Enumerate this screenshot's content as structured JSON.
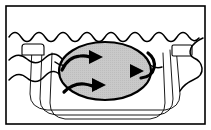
{
  "figure": {
    "width": 211,
    "height": 130,
    "background_color": "#ffffff",
    "caption": ""
  },
  "frame": {
    "label": "Figure border",
    "stroke_color": "#000000",
    "stroke_width": 1.6,
    "x": 6,
    "y": 6,
    "width": 199,
    "height": 118
  },
  "basin": {
    "label": "Basin / container walls",
    "stroke_color": "#000000",
    "fill": "none",
    "wall_count": 3,
    "walls": [
      {
        "name": "inner-wall",
        "stroke_width": 0.9,
        "path": "M 32,47 L 30,94 Q 30,108 47,110 L 165,110 Q 180,108 180,94 L 176,47"
      },
      {
        "name": "middle-wall",
        "stroke_width": 0.9,
        "path": "M 42,50 L 40,99 Q 40,113 56,115 L 158,115 Q 173,113 173,99 L 170,50"
      },
      {
        "name": "outer-wall",
        "stroke_width": 0.9,
        "path": "M 52,53 L 50,103 Q 50,117 65,119 L 150,119 Q 165,117 165,103 L 163,53"
      }
    ]
  },
  "handles": [
    {
      "name": "left-handle",
      "stroke_color": "#000000",
      "stroke_width": 1.1,
      "x": 22,
      "y": 44,
      "width": 22,
      "height": 11,
      "radius": 3
    },
    {
      "name": "right-handle",
      "stroke_color": "#000000",
      "stroke_width": 1.1,
      "x": 172,
      "y": 45,
      "width": 20,
      "height": 11,
      "radius": 2
    }
  ],
  "water_waves": {
    "label": "Water surface wave lines",
    "stroke_color": "#000000",
    "stroke_width": 1.5,
    "lines": [
      {
        "name": "wave-line-top",
        "description": "Main water surface spanning full width",
        "path": "M 9,37 q 6,-9 12,0 q 6,9 12,0 q 6,-9 12,0 q 6,9 12,0 q 6,-9 12,0 q 6,9 12,0 q 6,-9 12,0 q 6,9 12,0 q 6,-9 12,0 q 6,9 12,0 q 6,-9 12,0 q 6,9 12,0 q 6,-9 12,0 q 6,9 12,0 q 6,-9 12,0 q 5,7 10,1"
      },
      {
        "name": "wave-line-left-upper",
        "description": "Left interior wave crossing basin wall",
        "path": "M 9,60 q 9,-9 18,-1 q 9,8 18,-1 q 9,-9 18,2 q 8,10 16,3"
      },
      {
        "name": "wave-line-left-lower",
        "description": "Lower-left interior wave",
        "path": "M 9,80 q 9,-10 18,-2 q 9,8 18,-2 q 9,-10 18,2 q 9,12 18,4"
      },
      {
        "name": "wave-line-right-swirl",
        "description": "Right wave curving down toward the ellipse",
        "path": "M 203,38 q -9,4 -12,10 q -3,7 3,10 q 7,3 8,10 q 1,8 -9,12 q -9,4 -13,11"
      }
    ]
  },
  "ellipse_region": {
    "name": "convergence-zone-ellipse",
    "label": "Shaded convergence region",
    "cx": 105,
    "cy": 71,
    "rx": 46,
    "ry": 29,
    "fill_color": "#c9c9c9",
    "stroke_color": "#000000",
    "stroke_width": 2.1
  },
  "flow_arrows": {
    "label": "Flow direction arrows inside shaded zone",
    "color": "#000000",
    "stroke_width": 3.2,
    "count": 3,
    "items": [
      {
        "name": "arrow-upper-right",
        "direction": "right",
        "tail_path": "M 62,70 q 6,-13 18,-14 q 9,-1 13,3",
        "tip_points": "89,50 103,57 89,64",
        "description": "Curved arrow entering from lower-left, pointing right"
      },
      {
        "name": "arrow-lower-right",
        "direction": "right",
        "tail_path": "M 64,92 q 9,-9 20,-8 q 8,1 12,4",
        "tip_points": "92,78 106,85 92,92",
        "description": "Curved arrow entering from lower-left, pointing right"
      },
      {
        "name": "arrow-left",
        "direction": "left",
        "tail_path": "M 148,53 q 8,6 6,15 q -2,9 -13,10",
        "tip_points": "144,71 130,64 130,78",
        "description": "Curved arrow entering from upper-right, pointing left"
      }
    ]
  },
  "colors": {
    "ink": "#000000",
    "paper": "#ffffff",
    "shade": "#c9c9c9"
  }
}
